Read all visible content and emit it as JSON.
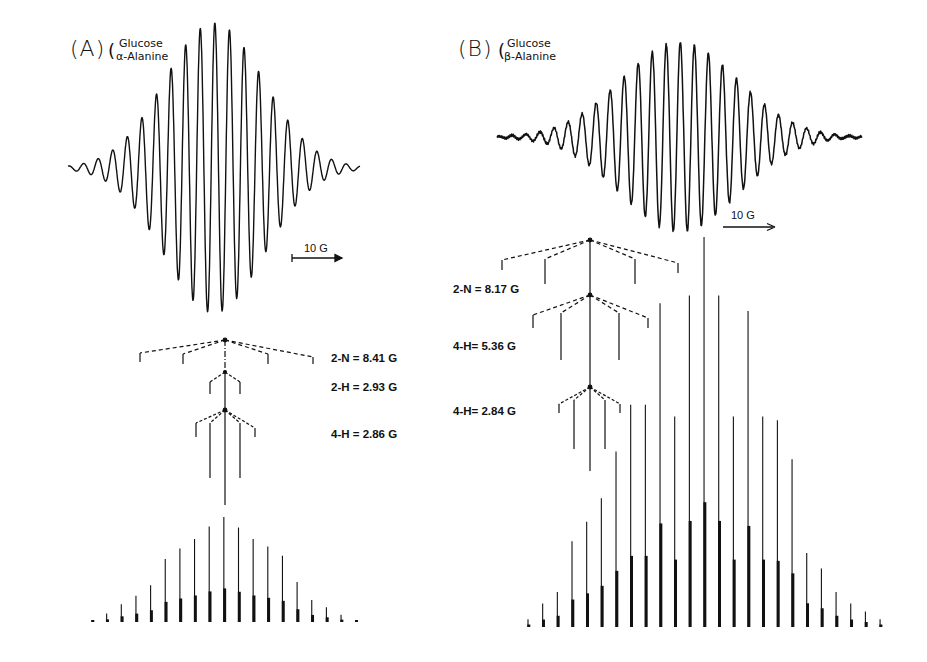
{
  "figure": {
    "panel_a": {
      "letter": "(A)",
      "paren": "(",
      "system_line1": "Glucose",
      "system_line2": "α-Alanine",
      "scale_label": "10 G",
      "couplings": [
        {
          "label": "2-N = 8.41 G"
        },
        {
          "label": "2-H = 2.93 G"
        },
        {
          "label": "4-H = 2.86 G"
        }
      ]
    },
    "panel_b": {
      "letter": "(B)",
      "paren": "(",
      "system_line1": "Glucose",
      "system_line2": "β-Alanine",
      "scale_label": "10 G",
      "couplings": [
        {
          "label": "2-N = 8.17 G"
        },
        {
          "label": "4-H= 5.36 G"
        },
        {
          "label": "4-H= 2.84 G"
        }
      ]
    }
  },
  "chart_data": [
    {
      "type": "line",
      "title": "(A) Glucose / α-Alanine — experimental EPR spectrum with simulated stick spectrum",
      "xlabel": "Magnetic field",
      "ylabel": "",
      "scale_bar": "10 G",
      "hyperfine_couplings_G": {
        "2-N": 8.41,
        "2-H": 2.93,
        "4-H": 2.86
      },
      "stick_relative_heights": [
        0.02,
        0.08,
        0.17,
        0.25,
        0.35,
        0.6,
        0.7,
        0.79,
        0.91,
        1.0,
        0.9,
        0.79,
        0.72,
        0.63,
        0.38,
        0.21,
        0.14,
        0.07,
        0.02
      ]
    },
    {
      "type": "line",
      "title": "(B) Glucose / β-Alanine — experimental EPR spectrum with simulated stick spectrum",
      "xlabel": "Magnetic field",
      "ylabel": "",
      "scale_bar": "10 G",
      "hyperfine_couplings_G": {
        "2-N": 8.17,
        "4-H(1)": 5.36,
        "4-H(2)": 2.84
      },
      "stick_relative_heights": [
        0.02,
        0.06,
        0.09,
        0.22,
        0.27,
        0.33,
        0.45,
        0.57,
        0.57,
        0.83,
        0.54,
        0.85,
        1.0,
        0.85,
        0.54,
        0.81,
        0.54,
        0.53,
        0.43,
        0.19,
        0.15,
        0.09,
        0.06,
        0.04,
        0.02
      ]
    }
  ]
}
